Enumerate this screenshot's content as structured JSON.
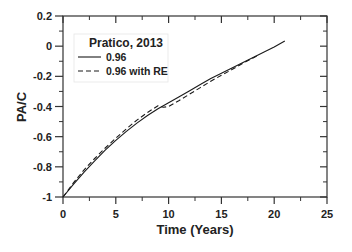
{
  "chart_data": {
    "type": "line",
    "title": "",
    "xlabel": "Time (Years)",
    "ylabel": "PA/C",
    "xlim": [
      0,
      25
    ],
    "ylim": [
      -1,
      0.2
    ],
    "x_ticks": [
      0,
      5,
      10,
      15,
      20,
      25
    ],
    "x_tick_labels": [
      "0",
      "5",
      "10",
      "15",
      "20",
      "25"
    ],
    "y_ticks": [
      -1,
      -0.8,
      -0.6,
      -0.4,
      -0.2,
      0,
      0.2
    ],
    "y_tick_labels": [
      "-1",
      "-0.8",
      "-0.6",
      "-0.4",
      "-0.2",
      "0",
      "0.2"
    ],
    "grid": false,
    "legend": {
      "title": "Pratico, 2013",
      "position": "upper-left",
      "entries": [
        {
          "label": "0.96",
          "style": "solid"
        },
        {
          "label": "0.96 with RE",
          "style": "dashed"
        }
      ]
    },
    "series": [
      {
        "name": "0.96",
        "style": "solid",
        "color": "#1a1a1a",
        "x": [
          0,
          1,
          2,
          3,
          4,
          5,
          6,
          7,
          8,
          9,
          10,
          11,
          12,
          13,
          14,
          15,
          16,
          17,
          18,
          19,
          20,
          21
        ],
        "y": [
          -1,
          -0.915,
          -0.835,
          -0.76,
          -0.69,
          -0.625,
          -0.565,
          -0.51,
          -0.46,
          -0.415,
          -0.375,
          -0.335,
          -0.295,
          -0.255,
          -0.215,
          -0.18,
          -0.145,
          -0.11,
          -0.075,
          -0.04,
          -0.005,
          0.035
        ]
      },
      {
        "name": "0.96 with RE",
        "style": "dashed",
        "color": "#1a1a1a",
        "x": [
          0,
          1,
          2,
          3,
          4,
          5,
          6,
          7,
          8,
          9,
          9.5,
          10,
          11,
          12,
          13,
          14,
          15,
          16,
          17,
          18,
          18.5
        ],
        "y": [
          -1,
          -0.905,
          -0.82,
          -0.745,
          -0.675,
          -0.61,
          -0.548,
          -0.49,
          -0.44,
          -0.395,
          -0.405,
          -0.4,
          -0.36,
          -0.318,
          -0.275,
          -0.232,
          -0.193,
          -0.155,
          -0.115,
          -0.078,
          -0.06
        ]
      }
    ]
  }
}
